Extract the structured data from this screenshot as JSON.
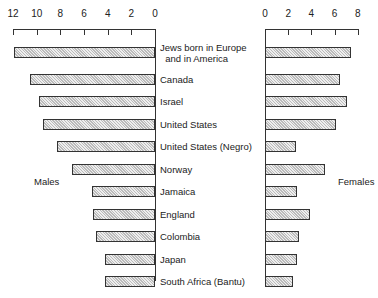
{
  "chart_data": {
    "type": "bar",
    "orientation": "horizontal",
    "layout": "back-to-back (population pyramid style)",
    "categories": [
      "Jews born in Europe\n  and in America",
      "Canada",
      "Israel",
      "United States",
      "United States (Negro)",
      "Norway",
      "Jamaica",
      "England",
      "Colombia",
      "Japan",
      "South Africa (Bantu)",
      "Bombay"
    ],
    "series": [
      {
        "name": "Males",
        "side": "left",
        "values": [
          11.9,
          10.6,
          9.8,
          9.5,
          8.3,
          7.0,
          5.3,
          5.2,
          5.0,
          4.2,
          4.2,
          2.8
        ]
      },
      {
        "name": "Females",
        "side": "right",
        "values": [
          7.4,
          6.5,
          7.1,
          6.1,
          2.7,
          5.2,
          2.8,
          3.9,
          2.9,
          2.8,
          2.4,
          2.6
        ]
      }
    ],
    "axes": {
      "left": {
        "ticks": [
          "12",
          "10",
          "8",
          "6",
          "4",
          "2",
          "0"
        ],
        "range": [
          0,
          12
        ],
        "reversed": true
      },
      "right": {
        "ticks": [
          "0",
          "2",
          "4",
          "6",
          "8"
        ],
        "range": [
          0,
          8
        ]
      }
    },
    "side_labels": {
      "left": "Males",
      "right": "Females"
    },
    "grid": false,
    "title": ""
  },
  "labels": {
    "males": "Males",
    "females": "Females"
  }
}
